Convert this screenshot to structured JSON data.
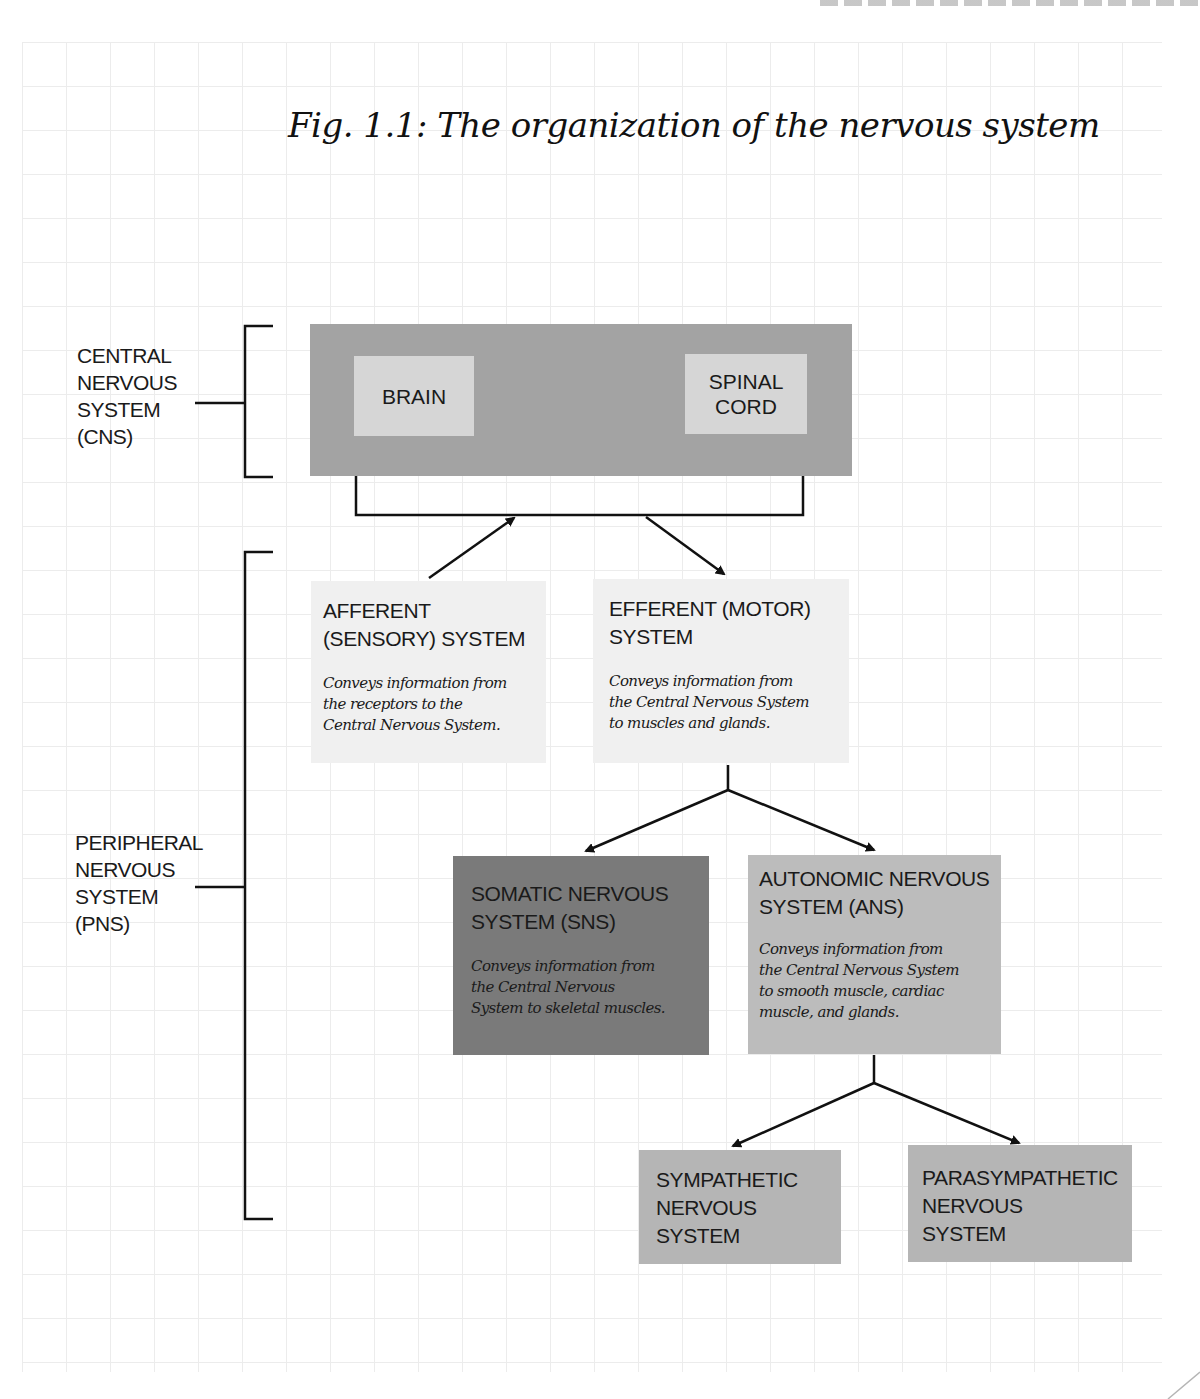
{
  "figure": {
    "title": "Fig. 1.1: The organization of the nervous system"
  },
  "side_labels": {
    "cns": "CENTRAL\nNERVOUS\nSYSTEM\n(CNS)",
    "pns": "PERIPHERAL\nNERVOUS\nSYSTEM\n(PNS)"
  },
  "cns": {
    "brain": "BRAIN",
    "spinal_cord": "SPINAL\nCORD"
  },
  "nodes": {
    "afferent": {
      "title": "AFFERENT\n(SENSORY) SYSTEM",
      "description": "Conveys information from\nthe receptors to the\nCentral Nervous System."
    },
    "efferent": {
      "title": "EFFERENT (MOTOR)\nSYSTEM",
      "description": "Conveys information from\nthe Central Nervous System\nto muscles  and glands."
    },
    "somatic": {
      "title": "SOMATIC NERVOUS\nSYSTEM (SNS)",
      "description": "Conveys information from\nthe Central Nervous\nSystem to skeletal muscles."
    },
    "autonomic": {
      "title": "AUTONOMIC NERVOUS\nSYSTEM (ANS)",
      "description": "Conveys information from\nthe Central Nervous System\nto smooth muscle, cardiac\nmuscle, and glands."
    },
    "sympathetic": {
      "title": "SYMPATHETIC\nNERVOUS\nSYSTEM"
    },
    "parasympathetic": {
      "title": "PARASYMPATHETIC\nNERVOUS\nSYSTEM"
    }
  },
  "colors": {
    "cns_outer": "#a3a3a3",
    "cns_inner": "#d6d6d6",
    "afferent_efferent": "#f0f0f0",
    "somatic": "#7a7a7a",
    "autonomic": "#bcbcbc",
    "sympathetic_parasympathetic": "#b5b5b5",
    "grid": "#ececec",
    "lines": "#111111"
  }
}
